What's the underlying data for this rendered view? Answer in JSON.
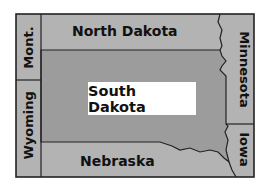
{
  "map": {
    "colors": {
      "neighbor_fill": "#b3b3b3",
      "focus_fill": "#9c9c9c",
      "border": "#222222",
      "label_box": "#ffffff"
    },
    "focus_state": "South Dakota",
    "states": {
      "north_dakota": "North Dakota",
      "minnesota": "Minnesota",
      "montana": "Mont.",
      "wyoming": "Wyoming",
      "south_dakota": "South Dakota",
      "nebraska": "Nebraska",
      "iowa": "Iowa"
    }
  }
}
